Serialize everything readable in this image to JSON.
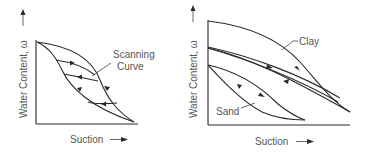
{
  "panels": [
    {
      "id": "left",
      "y_axis_label": "Water  Content, ω",
      "x_axis_label": "Suction",
      "annotation": {
        "line1": "Scanning",
        "line2": "Curve"
      }
    },
    {
      "id": "right",
      "y_axis_label": "Water  Content, ω",
      "x_axis_label": "Suction",
      "labels": {
        "clay": "Clay",
        "sand": "Sand"
      }
    }
  ],
  "colors": {
    "line": "#2a2a2a",
    "text": "#555555",
    "background": "#ffffff"
  }
}
